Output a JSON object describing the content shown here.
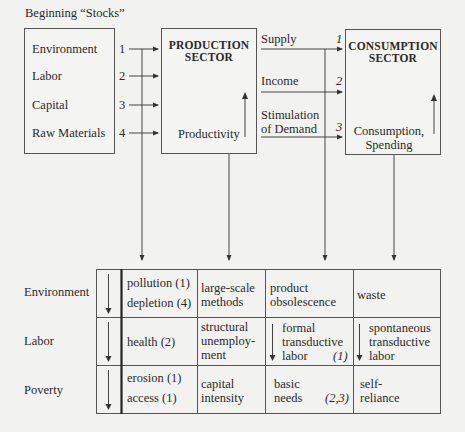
{
  "title": "Beginning “Stocks”",
  "stocks": {
    "items": [
      {
        "label": "Environment",
        "num": "1"
      },
      {
        "label": "Labor",
        "num": "2"
      },
      {
        "label": "Capital",
        "num": "3"
      },
      {
        "label": "Raw Materials",
        "num": "4"
      }
    ]
  },
  "production": {
    "title_line1": "PRODUCTION",
    "title_line2": "SECTOR",
    "bottom_label": "Productivity"
  },
  "flows": [
    {
      "label_line1": "Supply",
      "label_line2": "",
      "num": "1"
    },
    {
      "label_line1": "Income",
      "label_line2": "",
      "num": "2"
    },
    {
      "label_line1": "Stimulation",
      "label_line2": "of Demand",
      "num": "3"
    }
  ],
  "consumption": {
    "title_line1": "CONSUMPTION",
    "title_line2": "SECTOR",
    "bottom_line1": "Consumption,",
    "bottom_line2": "Spending"
  },
  "table": {
    "rows": [
      {
        "label": "Environment",
        "c1": [
          "pollution (1)",
          "depletion (4)"
        ],
        "c2": [
          "large-scale",
          "methods"
        ],
        "c3": [
          "product",
          "obsolescence"
        ],
        "c3_note": "",
        "c4": [
          "waste"
        ]
      },
      {
        "label": "Labor",
        "c1": [
          "health (2)"
        ],
        "c2": [
          "structural",
          "unemploy-",
          "ment"
        ],
        "c3": [
          "formal",
          "transductive",
          "labor"
        ],
        "c3_note": "(1)",
        "c4": [
          "spontaneous",
          "transductive",
          "labor"
        ]
      },
      {
        "label": "Poverty",
        "c1": [
          "erosion (1)",
          "access (1)"
        ],
        "c2": [
          "capital",
          "intensity"
        ],
        "c3": [
          "basic",
          "needs"
        ],
        "c3_note": "(2,3)",
        "c4": [
          "self-",
          "reliance"
        ]
      }
    ]
  }
}
